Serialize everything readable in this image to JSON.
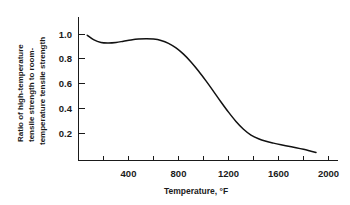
{
  "chart_data": {
    "type": "line",
    "title": "",
    "subtitle": "",
    "xlabel": "Temperature, °F",
    "ylabel": "Ratio of high-temperature tensile strength to room-temperature tensile strength",
    "ylabel_lines": [
      "Ratio of high-temperature",
      "tensile strength to room-",
      "temperature tensile strength"
    ],
    "xlim": [
      0,
      2080
    ],
    "ylim": [
      0,
      1.12
    ],
    "grid": false,
    "legend": false,
    "legend_position": "none",
    "x_major_ticks": [
      400,
      800,
      1200,
      1600,
      2000
    ],
    "x_major_tick_labels": [
      "400",
      "800",
      "1200",
      "1600",
      "2000"
    ],
    "x_minor_ticks": [
      200,
      600,
      1000,
      1400,
      1800
    ],
    "y_major_ticks": [
      0.2,
      0.4,
      0.6,
      0.8,
      1.0
    ],
    "y_major_tick_labels": [
      "0.2",
      "0.4",
      "0.6",
      "0.8",
      "1.0"
    ],
    "series": [
      {
        "name": "Tensile strength ratio",
        "color": "#111111",
        "x": [
          70,
          120,
          180,
          240,
          300,
          360,
          420,
          480,
          540,
          600,
          660,
          720,
          780,
          840,
          900,
          960,
          1020,
          1080,
          1140,
          1200,
          1260,
          1320,
          1380,
          1440,
          1500,
          1560,
          1620,
          1680,
          1740,
          1800,
          1860,
          1900
        ],
        "y": [
          1.01,
          0.975,
          0.952,
          0.948,
          0.952,
          0.962,
          0.972,
          0.979,
          0.981,
          0.979,
          0.968,
          0.945,
          0.908,
          0.858,
          0.795,
          0.722,
          0.642,
          0.558,
          0.472,
          0.39,
          0.315,
          0.252,
          0.205,
          0.175,
          0.155,
          0.14,
          0.127,
          0.115,
          0.103,
          0.09,
          0.075,
          0.065
        ]
      }
    ]
  }
}
